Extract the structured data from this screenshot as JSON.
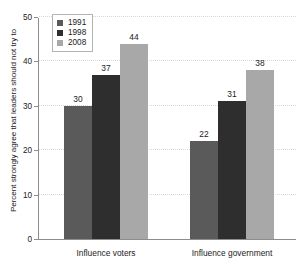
{
  "chart_data": {
    "type": "bar",
    "title": "",
    "subtitle": "",
    "xlabel": "",
    "ylabel": "Percent strongly agree that leaders should not try to",
    "categories": [
      "Influence voters",
      "Influence government"
    ],
    "series": [
      {
        "name": "1991",
        "color": "#5a5a5a",
        "values": [
          30,
          22
        ]
      },
      {
        "name": "1998",
        "color": "#2e2e2e",
        "values": [
          37,
          31
        ]
      },
      {
        "name": "2008",
        "color": "#a8a8a8",
        "values": [
          44,
          38
        ]
      }
    ],
    "ylim": [
      0,
      50
    ],
    "yticks": [
      0,
      10,
      20,
      30,
      40,
      50
    ],
    "ytick_labels": [
      "0",
      "10",
      "20",
      "30",
      "40",
      "50"
    ],
    "grid": true,
    "grid_axis": "y",
    "legend_position": "upper left",
    "data_labels": true,
    "bar_gap_within_group": 0,
    "axis_color": "#8d8d8d",
    "text_color": "#1b1b1b",
    "background": "#ffffff"
  }
}
